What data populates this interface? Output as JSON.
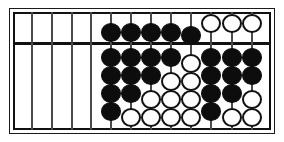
{
  "figure": {
    "name": "abacus",
    "type": "suanpan-abacus-diagram",
    "title": "",
    "background_color": "#ffffff",
    "frame_color": "#111111",
    "beam_color": "#111111",
    "rod_color": "#4a4a4a",
    "bead_active_color": "#0d0d0d",
    "bead_inactive_color": "#ffffff"
  },
  "geometry": {
    "width": 284,
    "height": 142,
    "frame_outer": {
      "x": 9,
      "y": 8,
      "w": 266,
      "h": 126
    },
    "frame_inner": {
      "x": 13,
      "y": 12,
      "w": 258,
      "h": 118
    },
    "beam_y": 30,
    "rod_count": 12,
    "upper_beads_per_rod": 1,
    "lower_beads_per_rod": 5,
    "bead_diameter": 20,
    "rod_x": [
      19,
      39,
      59,
      78,
      98,
      118,
      138,
      158,
      178,
      198,
      219,
      239
    ]
  },
  "rods": [
    {
      "index": 1,
      "label": "rod-1",
      "upper": [],
      "lower": []
    },
    {
      "index": 2,
      "label": "rod-2",
      "upper": [],
      "lower": []
    },
    {
      "index": 3,
      "label": "rod-3",
      "upper": [],
      "lower": []
    },
    {
      "index": 4,
      "label": "rod-4",
      "upper": [],
      "lower": []
    },
    {
      "index": 5,
      "label": "rod-5",
      "upper": [
        {
          "state": "up",
          "color": "black",
          "y": 11
        }
      ],
      "lower": [
        {
          "state": "up",
          "color": "black",
          "y": 36
        },
        {
          "state": "up",
          "color": "black",
          "y": 54
        },
        {
          "state": "up",
          "color": "black",
          "y": 72
        },
        {
          "state": "up",
          "color": "black",
          "y": 90
        }
      ]
    },
    {
      "index": 6,
      "label": "rod-6",
      "upper": [
        {
          "state": "up",
          "color": "black",
          "y": 11
        }
      ],
      "lower": [
        {
          "state": "up",
          "color": "black",
          "y": 36
        },
        {
          "state": "up",
          "color": "black",
          "y": 54
        },
        {
          "state": "up",
          "color": "black",
          "y": 72
        },
        {
          "state": "down",
          "color": "white",
          "y": 96
        }
      ]
    },
    {
      "index": 7,
      "label": "rod-7",
      "upper": [
        {
          "state": "up",
          "color": "black",
          "y": 11
        }
      ],
      "lower": [
        {
          "state": "up",
          "color": "black",
          "y": 36
        },
        {
          "state": "up",
          "color": "black",
          "y": 54
        },
        {
          "state": "down",
          "color": "white",
          "y": 78
        },
        {
          "state": "down",
          "color": "white",
          "y": 96
        }
      ]
    },
    {
      "index": 8,
      "label": "rod-8",
      "upper": [
        {
          "state": "up",
          "color": "black",
          "y": 11
        }
      ],
      "lower": [
        {
          "state": "up",
          "color": "black",
          "y": 36
        },
        {
          "state": "down",
          "color": "white",
          "y": 60
        },
        {
          "state": "down",
          "color": "white",
          "y": 78
        },
        {
          "state": "down",
          "color": "white",
          "y": 96
        }
      ]
    },
    {
      "index": 9,
      "label": "rod-9",
      "upper": [
        {
          "state": "up",
          "color": "black",
          "y": 14
        }
      ],
      "lower": [
        {
          "state": "down",
          "color": "white",
          "y": 42
        },
        {
          "state": "down",
          "color": "white",
          "y": 60
        },
        {
          "state": "down",
          "color": "white",
          "y": 78
        },
        {
          "state": "down",
          "color": "white",
          "y": 96
        }
      ]
    },
    {
      "index": 10,
      "label": "rod-10",
      "upper": [
        {
          "state": "down",
          "color": "white",
          "y": 2
        }
      ],
      "lower": [
        {
          "state": "up",
          "color": "black",
          "y": 36
        },
        {
          "state": "up",
          "color": "black",
          "y": 54
        },
        {
          "state": "up",
          "color": "black",
          "y": 72
        },
        {
          "state": "up",
          "color": "black",
          "y": 90
        }
      ]
    },
    {
      "index": 11,
      "label": "rod-11",
      "upper": [
        {
          "state": "down",
          "color": "white",
          "y": 2
        }
      ],
      "lower": [
        {
          "state": "up",
          "color": "black",
          "y": 36
        },
        {
          "state": "up",
          "color": "black",
          "y": 54
        },
        {
          "state": "up",
          "color": "black",
          "y": 72
        },
        {
          "state": "down",
          "color": "white",
          "y": 96
        }
      ]
    },
    {
      "index": 12,
      "label": "rod-12",
      "upper": [
        {
          "state": "down",
          "color": "white",
          "y": 2
        }
      ],
      "lower": [
        {
          "state": "up",
          "color": "black",
          "y": 36
        },
        {
          "state": "up",
          "color": "black",
          "y": 54
        },
        {
          "state": "down",
          "color": "white",
          "y": 78
        },
        {
          "state": "down",
          "color": "white",
          "y": 96
        }
      ]
    },
    {
      "index": 13,
      "label": "rod-13",
      "upper": [
        {
          "state": "down",
          "color": "white",
          "y": 2
        }
      ],
      "lower": [
        {
          "state": "up",
          "color": "black",
          "y": 36
        },
        {
          "state": "down",
          "color": "white",
          "y": 60
        },
        {
          "state": "down",
          "color": "white",
          "y": 78
        },
        {
          "state": "down",
          "color": "white",
          "y": 96
        }
      ]
    }
  ]
}
